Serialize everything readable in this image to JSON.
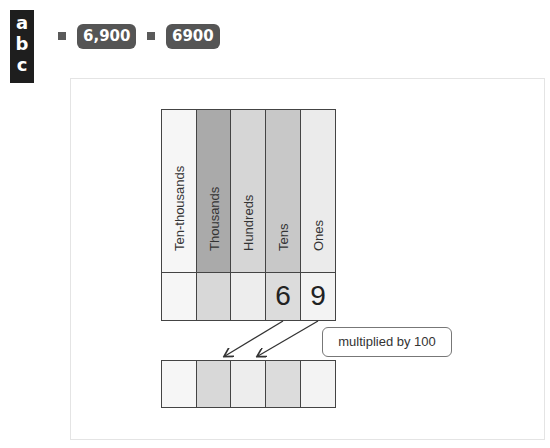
{
  "label_box": {
    "letters": [
      "a",
      "b",
      "c"
    ]
  },
  "answers": [
    {
      "value": "6,900"
    },
    {
      "value": "6900"
    }
  ],
  "colors": {
    "ten_thousands": "#f6f6f6",
    "thousands": "#aaaaaa",
    "hundreds": "#d6d6d6",
    "tens": "#c8c8c8",
    "ones": "#ebebeb",
    "pill": "#555555",
    "line": "#444444"
  },
  "place_value_table": {
    "columns": [
      {
        "header": "Ten-thousands",
        "value": ""
      },
      {
        "header": "Thousands",
        "value": ""
      },
      {
        "header": "Hundreds",
        "value": ""
      },
      {
        "header": "Tens",
        "value": "6"
      },
      {
        "header": "Ones",
        "value": "9"
      }
    ]
  },
  "result_row": {
    "cells": [
      "",
      "",
      "",
      "",
      ""
    ]
  },
  "callout": {
    "text": "multiplied by 100"
  }
}
